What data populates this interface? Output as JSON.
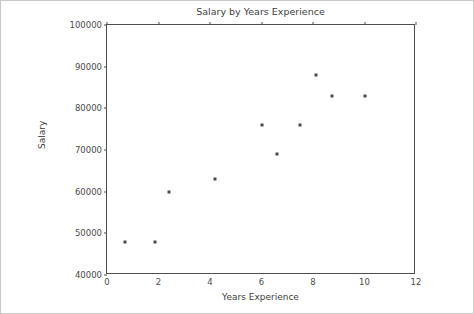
{
  "chart_data": {
    "type": "scatter",
    "title": "Salary by Years Experience",
    "xlabel": "Years Experience",
    "ylabel": "Salary",
    "xlim": [
      0,
      12
    ],
    "ylim": [
      40000,
      100000
    ],
    "xticks": [
      "0",
      "2",
      "4",
      "6",
      "8",
      "10",
      "12"
    ],
    "xtick_values": [
      0,
      2,
      4,
      6,
      8,
      10,
      12
    ],
    "yticks": [
      "40000",
      "50000",
      "60000",
      "70000",
      "80000",
      "90000",
      "100000"
    ],
    "ytick_values": [
      40000,
      50000,
      60000,
      70000,
      80000,
      90000,
      100000
    ],
    "grid": false,
    "legend": null,
    "marker_color": "#4a4a4a",
    "points": [
      {
        "x": 0.7,
        "y": 48000
      },
      {
        "x": 1.85,
        "y": 48000
      },
      {
        "x": 2.4,
        "y": 60000
      },
      {
        "x": 4.2,
        "y": 63000
      },
      {
        "x": 6.0,
        "y": 76000
      },
      {
        "x": 6.6,
        "y": 69000
      },
      {
        "x": 7.5,
        "y": 76000
      },
      {
        "x": 8.1,
        "y": 88000
      },
      {
        "x": 8.75,
        "y": 83000
      },
      {
        "x": 10.0,
        "y": 83000
      }
    ]
  },
  "figure": {
    "background": "#ffffff",
    "border_color": "#c8c8c8",
    "axes_color": "#4d4d4d"
  }
}
